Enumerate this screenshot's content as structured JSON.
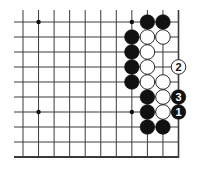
{
  "diagram": {
    "type": "go-board-fragment",
    "columns": 11,
    "rows": 10,
    "edges": {
      "right": true,
      "bottom": true,
      "top": false,
      "left": false
    },
    "colors": {
      "line": "#3a3a3a",
      "black": "#111111",
      "white": "#ffffff",
      "background": "#ffffff"
    },
    "star_points": [
      {
        "col": 1,
        "row": 0
      },
      {
        "col": 7,
        "row": 0
      },
      {
        "col": 1,
        "row": 6
      },
      {
        "col": 7,
        "row": 6
      }
    ],
    "stones": [
      {
        "col": 8,
        "row": 0,
        "color": "black"
      },
      {
        "col": 9,
        "row": 0,
        "color": "black"
      },
      {
        "col": 7,
        "row": 1,
        "color": "black"
      },
      {
        "col": 8,
        "row": 1,
        "color": "white"
      },
      {
        "col": 9,
        "row": 1,
        "color": "white"
      },
      {
        "col": 7,
        "row": 2,
        "color": "black"
      },
      {
        "col": 8,
        "row": 2,
        "color": "white"
      },
      {
        "col": 7,
        "row": 3,
        "color": "black"
      },
      {
        "col": 8,
        "row": 3,
        "color": "white"
      },
      {
        "col": 10,
        "row": 3,
        "color": "white",
        "label": "2"
      },
      {
        "col": 7,
        "row": 4,
        "color": "black"
      },
      {
        "col": 8,
        "row": 4,
        "color": "white"
      },
      {
        "col": 9,
        "row": 4,
        "color": "white"
      },
      {
        "col": 8,
        "row": 5,
        "color": "black"
      },
      {
        "col": 9,
        "row": 5,
        "color": "white"
      },
      {
        "col": 10,
        "row": 5,
        "color": "black",
        "label": "3"
      },
      {
        "col": 8,
        "row": 6,
        "color": "black"
      },
      {
        "col": 9,
        "row": 6,
        "color": "white"
      },
      {
        "col": 10,
        "row": 6,
        "color": "black",
        "label": "1"
      },
      {
        "col": 8,
        "row": 7,
        "color": "black"
      },
      {
        "col": 9,
        "row": 7,
        "color": "black"
      }
    ]
  }
}
